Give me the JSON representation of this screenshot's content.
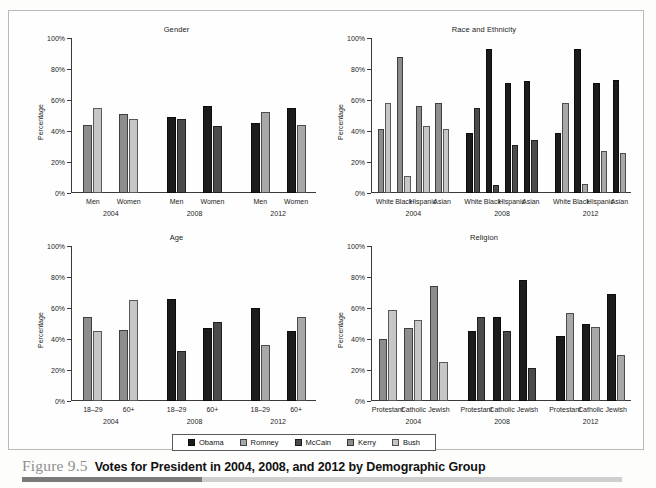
{
  "figure": {
    "number": "Figure 9.5",
    "title": "Votes for President in 2004, 2008, and 2012 by Demographic Group"
  },
  "legend": {
    "items": [
      {
        "label": "Obama",
        "color": "#1c1c1c"
      },
      {
        "label": "Romney",
        "color": "#a8a8a8"
      },
      {
        "label": "McCain",
        "color": "#4a4a4a"
      },
      {
        "label": "Kerry",
        "color": "#8d8d8d"
      },
      {
        "label": "Bush",
        "color": "#c6c6c6"
      }
    ]
  },
  "axis": {
    "ylabel": "Percentage",
    "ticks": [
      "100%",
      "80%",
      "60%",
      "40%",
      "20%",
      "0%"
    ],
    "ylim": [
      0,
      100
    ]
  },
  "years": [
    "2004",
    "2008",
    "2012"
  ],
  "chart_data": [
    {
      "type": "bar",
      "title": "Gender",
      "xlabel": "",
      "ylabel": "Percentage",
      "ylim": [
        0,
        100
      ],
      "grid": false,
      "legend_position": "bottom-shared",
      "categories": [
        "Men",
        "Women",
        "Men",
        "Women",
        "Men",
        "Women"
      ],
      "year_groups": [
        {
          "year": "2004",
          "candidates": [
            "Kerry",
            "Bush"
          ],
          "colors": [
            "#8d8d8d",
            "#c6c6c6"
          ],
          "groups": [
            {
              "category": "Men",
              "values": [
                44,
                55
              ]
            },
            {
              "category": "Women",
              "values": [
                51,
                48
              ]
            }
          ]
        },
        {
          "year": "2008",
          "candidates": [
            "Obama",
            "McCain"
          ],
          "colors": [
            "#1c1c1c",
            "#4a4a4a"
          ],
          "groups": [
            {
              "category": "Men",
              "values": [
                49,
                48
              ]
            },
            {
              "category": "Women",
              "values": [
                56,
                43
              ]
            }
          ]
        },
        {
          "year": "2012",
          "candidates": [
            "Obama",
            "Romney"
          ],
          "colors": [
            "#1c1c1c",
            "#a8a8a8"
          ],
          "groups": [
            {
              "category": "Men",
              "values": [
                45,
                52
              ]
            },
            {
              "category": "Women",
              "values": [
                55,
                44
              ]
            }
          ]
        }
      ]
    },
    {
      "type": "bar",
      "title": "Race and Ethnicity",
      "xlabel": "",
      "ylabel": "Percentage",
      "ylim": [
        0,
        100
      ],
      "grid": false,
      "legend_position": "bottom-shared",
      "categories": [
        "White",
        "Black",
        "Hispanic",
        "Asian"
      ],
      "year_groups": [
        {
          "year": "2004",
          "candidates": [
            "Kerry",
            "Bush"
          ],
          "colors": [
            "#8d8d8d",
            "#c6c6c6"
          ],
          "groups": [
            {
              "category": "White",
              "values": [
                41,
                58
              ]
            },
            {
              "category": "Black",
              "values": [
                88,
                11
              ]
            },
            {
              "category": "Hispanic",
              "values": [
                56,
                43
              ]
            },
            {
              "category": "Asian",
              "values": [
                58,
                41
              ]
            }
          ]
        },
        {
          "year": "2008",
          "candidates": [
            "Obama",
            "McCain"
          ],
          "colors": [
            "#1c1c1c",
            "#4a4a4a"
          ],
          "groups": [
            {
              "category": "White",
              "values": [
                39,
                55
              ]
            },
            {
              "category": "Black",
              "values": [
                93,
                5
              ]
            },
            {
              "category": "Hispanic",
              "values": [
                71,
                31
              ]
            },
            {
              "category": "Asian",
              "values": [
                72,
                34
              ]
            }
          ]
        },
        {
          "year": "2012",
          "candidates": [
            "Obama",
            "Romney"
          ],
          "colors": [
            "#1c1c1c",
            "#a8a8a8"
          ],
          "groups": [
            {
              "category": "White",
              "values": [
                39,
                58
              ]
            },
            {
              "category": "Black",
              "values": [
                93,
                6
              ]
            },
            {
              "category": "Hispanic",
              "values": [
                71,
                27
              ]
            },
            {
              "category": "Asian",
              "values": [
                73,
                26
              ]
            }
          ]
        }
      ]
    },
    {
      "type": "bar",
      "title": "Age",
      "xlabel": "",
      "ylabel": "Percentage",
      "ylim": [
        0,
        100
      ],
      "grid": false,
      "legend_position": "bottom-shared",
      "categories": [
        "18–29",
        "60+"
      ],
      "year_groups": [
        {
          "year": "2004",
          "candidates": [
            "Kerry",
            "Bush"
          ],
          "colors": [
            "#8d8d8d",
            "#c6c6c6"
          ],
          "groups": [
            {
              "category": "18–29",
              "values": [
                54,
                45
              ]
            },
            {
              "category": "60+",
              "values": [
                46,
                65
              ]
            }
          ]
        },
        {
          "year": "2008",
          "candidates": [
            "Obama",
            "McCain"
          ],
          "colors": [
            "#1c1c1c",
            "#4a4a4a"
          ],
          "groups": [
            {
              "category": "18–29",
              "values": [
                66,
                32
              ]
            },
            {
              "category": "60+",
              "values": [
                47,
                51
              ]
            }
          ]
        },
        {
          "year": "2012",
          "candidates": [
            "Obama",
            "Romney"
          ],
          "colors": [
            "#1c1c1c",
            "#a8a8a8"
          ],
          "groups": [
            {
              "category": "18–29",
              "values": [
                60,
                36
              ]
            },
            {
              "category": "60+",
              "values": [
                45,
                54
              ]
            }
          ]
        }
      ]
    },
    {
      "type": "bar",
      "title": "Religion",
      "xlabel": "",
      "ylabel": "Percentage",
      "ylim": [
        0,
        100
      ],
      "grid": false,
      "legend_position": "bottom-shared",
      "categories": [
        "Protestant",
        "Catholic",
        "Jewish"
      ],
      "year_groups": [
        {
          "year": "2004",
          "candidates": [
            "Kerry",
            "Bush"
          ],
          "colors": [
            "#8d8d8d",
            "#c6c6c6"
          ],
          "groups": [
            {
              "category": "Protestant",
              "values": [
                40,
                59
              ]
            },
            {
              "category": "Catholic",
              "values": [
                47,
                52
              ]
            },
            {
              "category": "Jewish",
              "values": [
                74,
                25
              ]
            }
          ]
        },
        {
          "year": "2008",
          "candidates": [
            "Obama",
            "McCain"
          ],
          "colors": [
            "#1c1c1c",
            "#4a4a4a"
          ],
          "groups": [
            {
              "category": "Protestant",
              "values": [
                45,
                54
              ]
            },
            {
              "category": "Catholic",
              "values": [
                54,
                45
              ]
            },
            {
              "category": "Jewish",
              "values": [
                78,
                21
              ]
            }
          ]
        },
        {
          "year": "2012",
          "candidates": [
            "Obama",
            "Romney"
          ],
          "colors": [
            "#1c1c1c",
            "#a8a8a8"
          ],
          "groups": [
            {
              "category": "Protestant",
              "values": [
                42,
                57
              ]
            },
            {
              "category": "Catholic",
              "values": [
                50,
                48
              ]
            },
            {
              "category": "Jewish",
              "values": [
                69,
                30
              ]
            }
          ]
        }
      ]
    }
  ]
}
